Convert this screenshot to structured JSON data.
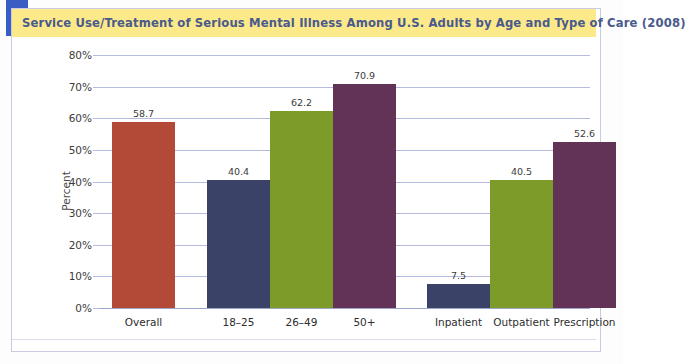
{
  "title": "Service Use/Treatment of Serious Mental Illness Among U.S. Adults by Age and Type of Care (2008)",
  "chart_data": {
    "type": "bar",
    "title": "Service Use/Treatment of Serious Mental Illness Among U.S. Adults by Age and Type of Care (2008)",
    "xlabel": "",
    "ylabel": "Percent",
    "ylim": [
      0,
      80
    ],
    "ytick_labels": [
      "0%",
      "10%",
      "20%",
      "30%",
      "40%",
      "50%",
      "60%",
      "70%",
      "80%"
    ],
    "ytick_values": [
      0,
      10,
      20,
      30,
      40,
      50,
      60,
      70,
      80
    ],
    "grid": true,
    "legend": "none",
    "categories": [
      "Overall",
      "18–25",
      "26–49",
      "50+",
      "",
      "Inpatient",
      "Outpatient",
      "Prescription"
    ],
    "values": [
      58.7,
      40.4,
      62.2,
      70.9,
      null,
      7.5,
      40.5,
      52.6
    ],
    "bars": [
      {
        "label": "Overall",
        "value": 58.7,
        "value_label": "58.7",
        "color": "#b34a38"
      },
      {
        "label": "18–25",
        "value": 40.4,
        "value_label": "40.4",
        "color": "#3b4268"
      },
      {
        "label": "26–49",
        "value": 62.2,
        "value_label": "62.2",
        "color": "#7d9b28"
      },
      {
        "label": "50+",
        "value": 70.9,
        "value_label": "70.9",
        "color": "#633257"
      },
      {
        "label": "Inpatient",
        "value": 7.5,
        "value_label": "7.5",
        "color": "#3b4268"
      },
      {
        "label": "Outpatient",
        "value": 40.5,
        "value_label": "40.5",
        "color": "#7d9b28"
      },
      {
        "label": "Prescription",
        "value": 52.6,
        "value_label": "52.6",
        "color": "#633257"
      }
    ],
    "colors": {
      "overall": "#b34a38",
      "age_18_25": "#3b4268",
      "age_26_49": "#7d9b28",
      "age_50_plus": "#633257",
      "gridline": "#b6bade",
      "banner": "#fbe98a",
      "banner_text": "#4a5a8c",
      "accent_block": "#3a5dc4"
    }
  }
}
